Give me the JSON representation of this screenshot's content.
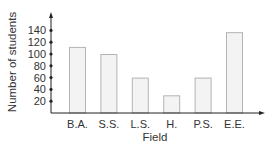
{
  "chart_data": {
    "type": "bar",
    "title": "",
    "xlabel": "Field",
    "ylabel": "Number of students",
    "categories": [
      "B.A.",
      "S.S.",
      "L.S.",
      "H.",
      "P.S.",
      "E.E."
    ],
    "values": [
      112,
      100,
      60,
      30,
      60,
      137
    ],
    "yticks": [
      20,
      40,
      60,
      80,
      100,
      120,
      140
    ],
    "ylim": [
      0,
      150
    ],
    "grid": false,
    "legend": null,
    "colors": {
      "bar_fill": "#f3f3f3",
      "bar_stroke": "#b3b3b3",
      "axis": "#222222",
      "text": "#333333"
    }
  }
}
